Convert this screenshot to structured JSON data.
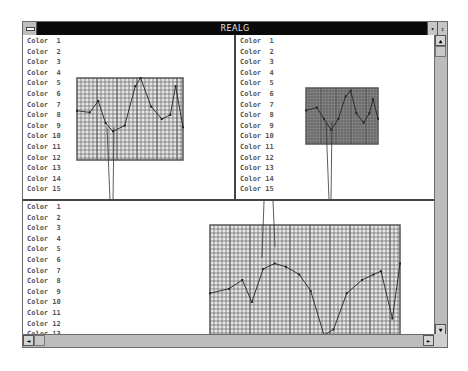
{
  "window": {
    "title": "REALG",
    "buttons": {
      "minimize": "▾",
      "maximize": "⇕"
    }
  },
  "scrollbars": {
    "vertical": {
      "up_arrow": "▲"
    },
    "horizontal": {
      "left_arrow": "◄",
      "right_arrow": "►"
    }
  },
  "panes": {
    "top_left": {
      "items": [
        "Color  1",
        "Color  2",
        "Color  3",
        "Color  4",
        "Color  5",
        "Color  6",
        "Color  7",
        "Color  8",
        "Color  9",
        "Color 10",
        "Color 11",
        "Color 12",
        "Color 13",
        "Color 14",
        "Color 15"
      ]
    },
    "top_right": {
      "items": [
        "Color  1",
        "Color  2",
        "Color  3",
        "Color  4",
        "Color  5",
        "Color  6",
        "Color  7",
        "Color  8",
        "Color  9",
        "Color 10",
        "Color 11",
        "Color 12",
        "Color 13",
        "Color 14",
        "Color 15"
      ]
    },
    "bottom": {
      "items": [
        "Color  1",
        "Color  2",
        "Color  3",
        "Color  4",
        "Color  5",
        "Color  6",
        "Color  7",
        "Color  8",
        "Color  9",
        "Color 10",
        "Color 11",
        "Color 12",
        "Color 13"
      ]
    }
  },
  "colors": {
    "titlebar": "#0a0a0a",
    "frame": "#c8c8c8",
    "grid_line": "#555555",
    "grid_fill_light": "#e6e6e6",
    "grid_fill_dark": "#8a8a8a",
    "trace": "#222222"
  },
  "charts": {
    "top_left": {
      "x": 54,
      "y": 43,
      "w": 106,
      "h": 82,
      "points": [
        [
          0,
          0.4
        ],
        [
          0.12,
          0.42
        ],
        [
          0.2,
          0.28
        ],
        [
          0.27,
          0.55
        ],
        [
          0.34,
          0.65
        ],
        [
          0.45,
          0.58
        ],
        [
          0.55,
          0.1
        ],
        [
          0.6,
          0.0
        ],
        [
          0.7,
          0.35
        ],
        [
          0.8,
          0.5
        ],
        [
          0.88,
          0.45
        ],
        [
          0.93,
          0.1
        ],
        [
          1,
          0.6
        ]
      ]
    },
    "top_right": {
      "x": 70,
      "y": 53,
      "w": 72,
      "h": 56,
      "points": [
        [
          0,
          0.4
        ],
        [
          0.15,
          0.35
        ],
        [
          0.25,
          0.55
        ],
        [
          0.35,
          0.75
        ],
        [
          0.45,
          0.55
        ],
        [
          0.55,
          0.15
        ],
        [
          0.62,
          0.05
        ],
        [
          0.7,
          0.45
        ],
        [
          0.8,
          0.62
        ],
        [
          0.88,
          0.45
        ],
        [
          0.93,
          0.2
        ],
        [
          1,
          0.55
        ]
      ]
    },
    "bottom": {
      "x": 187,
      "y": 24,
      "w": 190,
      "h": 110,
      "points": [
        [
          0,
          0.62
        ],
        [
          0.1,
          0.58
        ],
        [
          0.17,
          0.5
        ],
        [
          0.22,
          0.7
        ],
        [
          0.28,
          0.4
        ],
        [
          0.34,
          0.35
        ],
        [
          0.4,
          0.38
        ],
        [
          0.47,
          0.45
        ],
        [
          0.53,
          0.6
        ],
        [
          0.6,
          1.0
        ],
        [
          0.65,
          0.95
        ],
        [
          0.72,
          0.62
        ],
        [
          0.8,
          0.5
        ],
        [
          0.86,
          0.45
        ],
        [
          0.9,
          0.42
        ],
        [
          0.96,
          0.85
        ],
        [
          1,
          0.35
        ]
      ]
    }
  }
}
